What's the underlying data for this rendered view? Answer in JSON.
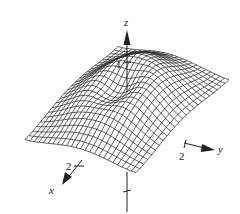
{
  "figure": {
    "type": "3d-wireframe-surface",
    "axes": {
      "z": {
        "label": "z",
        "tick_label": "1"
      },
      "x": {
        "label": "x",
        "tick_label": "2"
      },
      "y": {
        "label": "y",
        "tick_label": "2"
      }
    },
    "surface": {
      "domain": [
        -3,
        3
      ],
      "grid_lines": 24,
      "z_max": 1
    },
    "colors": {
      "mesh": "#333333",
      "axis": "#222222",
      "background": "#ffffff"
    }
  }
}
